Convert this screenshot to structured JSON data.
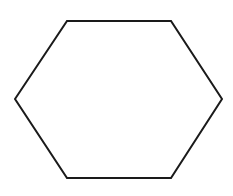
{
  "canvas": {
    "width": 233,
    "height": 196,
    "background_color": "#ffffff"
  },
  "figure": {
    "name": "hexagon",
    "label": "Hexagon",
    "sides": 6,
    "orientation": "pointy-left-right",
    "fill": "none",
    "fill_color": "#ffffff",
    "stroke_color": "#1a1a1a",
    "stroke_width": 2,
    "closed": true,
    "vertices": [
      {
        "name": "left",
        "x": 15,
        "y": 99
      },
      {
        "name": "top-left",
        "x": 67,
        "y": 21
      },
      {
        "name": "top-right",
        "x": 171,
        "y": 21
      },
      {
        "name": "right",
        "x": 222,
        "y": 99
      },
      {
        "name": "bottom-right",
        "x": 171,
        "y": 178
      },
      {
        "name": "bottom-left",
        "x": 67,
        "y": 178
      }
    ],
    "points_attr": "15,99 67,21 171,21 222,99 171,178 67,178"
  },
  "annotations": {
    "text_labels": []
  }
}
